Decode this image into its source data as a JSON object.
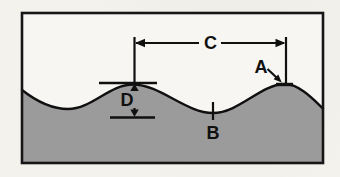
{
  "scene": {
    "background_color": "#f3f2ed",
    "frame_background_color": "#f7f6f2",
    "frame_border_color": "#161616",
    "wave_fill_color": "#9b9b9b",
    "wave_outline_color": "#101010",
    "annotation_color": "#101010"
  },
  "labels": {
    "a": "A",
    "b": "B",
    "c": "C",
    "d": "D"
  }
}
